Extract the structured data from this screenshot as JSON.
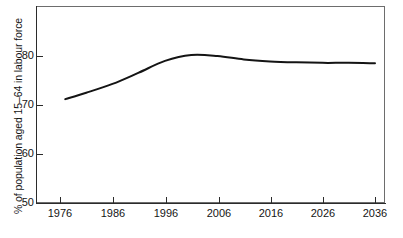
{
  "chart_data": {
    "type": "line",
    "title": "",
    "subtitle": "",
    "xlabel": "",
    "ylabel": "% of population aged 15–64 in labour force",
    "xlim": [
      1972,
      2040
    ],
    "ylim": [
      50,
      90
    ],
    "grid": false,
    "legend": "none",
    "x_ticks": [
      "1976",
      "1986",
      "1996",
      "2006",
      "2016",
      "2026",
      "2036"
    ],
    "y_ticks": [
      "50",
      "60",
      "70",
      "80"
    ],
    "series": [
      {
        "name": "Labour force participation rate",
        "color": "#141414",
        "x": [
          1977,
          1981,
          1986,
          1991,
          1996,
          2001,
          2006,
          2011,
          2016,
          2021,
          2026,
          2031,
          2036
        ],
        "values": [
          71.2,
          72.5,
          74.3,
          76.6,
          79.0,
          80.2,
          80.0,
          79.3,
          78.9,
          78.7,
          78.6,
          78.6,
          78.5
        ]
      }
    ],
    "annotations": []
  },
  "axes": {
    "y_title": "% of population aged 15–64 in labour force",
    "y_tick_labels": [
      "80",
      "70",
      "60",
      "50"
    ],
    "x_tick_labels": [
      "1976",
      "1986",
      "1996",
      "2006",
      "2016",
      "2026",
      "2036"
    ]
  },
  "colors": {
    "line": "#141414",
    "frame": "#6d6d6d",
    "spine": "#2b2b2b",
    "text": "#151515",
    "background": "#ffffff"
  }
}
